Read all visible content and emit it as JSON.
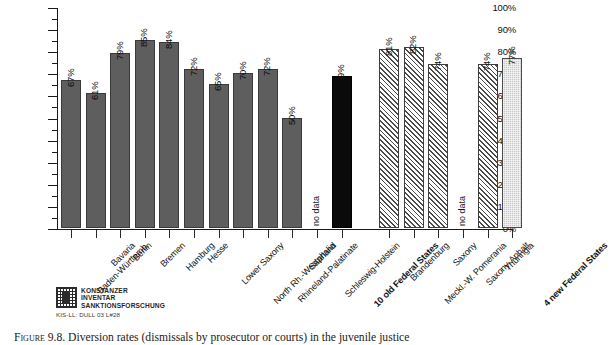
{
  "chart_data": {
    "type": "bar",
    "title": "",
    "xlabel": "",
    "ylabel": "",
    "ylim": [
      0,
      100
    ],
    "grid": false,
    "legend_position": "none",
    "unit": "%",
    "y_ticks": [
      "0%",
      "10%",
      "20%",
      "30%",
      "40%",
      "50%",
      "60%",
      "70%",
      "80%",
      "90%",
      "100%"
    ],
    "y_tick_values": [
      0,
      10,
      20,
      30,
      40,
      50,
      60,
      70,
      80,
      90,
      100
    ],
    "categories": [
      "Baden-Württemb.",
      "Bavaria",
      "Berlin",
      "Bremen",
      "Hamburg",
      "Hesse",
      "Lower Saxony",
      "North Rh.-Westphalia",
      "Rhineland-Palatinate",
      "Saarland",
      "Schleswig-Holstein",
      "10 old Federal States",
      "Brandenburg",
      "Meckl.-W. Pomerania",
      "Saxony",
      "Saxony-Anhalt",
      "Thuringia",
      "4 new Federal States"
    ],
    "values": [
      67,
      61,
      79,
      85,
      84,
      72,
      65,
      70,
      72,
      50,
      null,
      69,
      81,
      82,
      74,
      null,
      74,
      77
    ],
    "value_labels": [
      "67%",
      "61%",
      "79%",
      "85%",
      "84%",
      "72%",
      "65%",
      "70%",
      "72%",
      "50%",
      "no data",
      "69%",
      "81%",
      "82%",
      "74%",
      "no data",
      "74%",
      "77%"
    ],
    "missing_label": "no data",
    "bars": [
      {
        "category": "Baden-Württemb.",
        "value": 67,
        "label": "67%",
        "style": "solid-gray",
        "bold_label": false,
        "missing": false
      },
      {
        "category": "Bavaria",
        "value": 61,
        "label": "61%",
        "style": "solid-gray",
        "bold_label": false,
        "missing": false
      },
      {
        "category": "Berlin",
        "value": 79,
        "label": "79%",
        "style": "solid-gray",
        "bold_label": false,
        "missing": false
      },
      {
        "category": "Bremen",
        "value": 85,
        "label": "85%",
        "style": "solid-gray",
        "bold_label": false,
        "missing": false
      },
      {
        "category": "Hamburg",
        "value": 84,
        "label": "84%",
        "style": "solid-gray",
        "bold_label": false,
        "missing": false
      },
      {
        "category": "Hesse",
        "value": 72,
        "label": "72%",
        "style": "solid-gray",
        "bold_label": false,
        "missing": false
      },
      {
        "category": "Lower Saxony",
        "value": 65,
        "label": "65%",
        "style": "solid-gray",
        "bold_label": false,
        "missing": false
      },
      {
        "category": "North Rh.-Westphalia",
        "value": 70,
        "label": "70%",
        "style": "solid-gray",
        "bold_label": false,
        "missing": false
      },
      {
        "category": "Rhineland-Palatinate",
        "value": 72,
        "label": "72%",
        "style": "solid-gray",
        "bold_label": false,
        "missing": false
      },
      {
        "category": "Saarland",
        "value": 50,
        "label": "50%",
        "style": "solid-gray",
        "bold_label": false,
        "missing": false
      },
      {
        "category": "Schleswig-Holstein",
        "value": null,
        "label": "no data",
        "style": "none",
        "bold_label": false,
        "missing": true
      },
      {
        "category": "10 old Federal States",
        "value": 69,
        "label": "69%",
        "style": "solid-black",
        "bold_label": true,
        "missing": false
      },
      {
        "category": "Brandenburg",
        "value": 81,
        "label": "81%",
        "style": "hatch",
        "bold_label": false,
        "missing": false
      },
      {
        "category": "Meckl.-W. Pomerania",
        "value": 82,
        "label": "82%",
        "style": "hatch",
        "bold_label": false,
        "missing": false
      },
      {
        "category": "Saxony",
        "value": 74,
        "label": "74%",
        "style": "hatch",
        "bold_label": false,
        "missing": false
      },
      {
        "category": "Saxony-Anhalt",
        "value": null,
        "label": "no data",
        "style": "none",
        "bold_label": false,
        "missing": true
      },
      {
        "category": "Thuringia",
        "value": 74,
        "label": "74%",
        "style": "hatch",
        "bold_label": false,
        "missing": false
      },
      {
        "category": "4 new Federal States",
        "value": 77,
        "label": "77%",
        "style": "dotted",
        "bold_label": true,
        "missing": false
      }
    ]
  },
  "logo": {
    "line1": "KONSTANZER",
    "line2": "INVENTAR",
    "line3": "SANKTIONSFORSCHUNG",
    "reference": "KIS-LL: DULL 03 L#28"
  },
  "caption": {
    "figure_number": "Figure 9.8.",
    "text": "Diversion rates (dismissals by prosecutor or courts) in the juvenile justice"
  }
}
